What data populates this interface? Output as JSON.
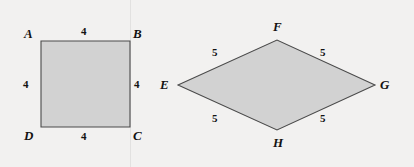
{
  "figure": {
    "background_color": "#f2f1f0",
    "shape_fill_color": "#d2d2d2",
    "shape_stroke_color": "#4a4a4a",
    "divider_color": "#e2e1e0",
    "divider_x": 130,
    "shapes": [
      {
        "id": "square-abcd",
        "name": "square ABCD",
        "type": "square",
        "points": "41,41 130,41 130,127 41,127",
        "vertices": [
          {
            "label": "A",
            "x": 24,
            "y": 27
          },
          {
            "label": "B",
            "x": 133,
            "y": 27
          },
          {
            "label": "C",
            "x": 133,
            "y": 129
          },
          {
            "label": "D",
            "x": 24,
            "y": 129
          }
        ],
        "side_labels": [
          {
            "value": "4",
            "x": 81,
            "y": 26
          },
          {
            "value": "4",
            "x": 134,
            "y": 79
          },
          {
            "value": "4",
            "x": 81,
            "y": 131
          },
          {
            "value": "4",
            "x": 23,
            "y": 79
          }
        ]
      },
      {
        "id": "rhombus-efgh",
        "name": "rhombus EFGH",
        "type": "rhombus",
        "points": "178,85 277,40 375,85 277,130",
        "vertices": [
          {
            "label": "E",
            "x": 160,
            "y": 78
          },
          {
            "label": "F",
            "x": 273,
            "y": 20
          },
          {
            "label": "G",
            "x": 380,
            "y": 78
          },
          {
            "label": "H",
            "x": 273,
            "y": 136
          }
        ],
        "side_labels": [
          {
            "value": "5",
            "x": 212,
            "y": 47
          },
          {
            "value": "5",
            "x": 320,
            "y": 47
          },
          {
            "value": "5",
            "x": 212,
            "y": 113
          },
          {
            "value": "5",
            "x": 320,
            "y": 113
          }
        ]
      }
    ]
  }
}
